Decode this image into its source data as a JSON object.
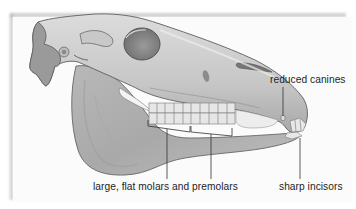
{
  "figure": {
    "style": "grayscale pencil illustration"
  },
  "labels": {
    "canines": "reduced canines",
    "molars": "large, flat molars and premolars",
    "incisors": "sharp incisors"
  },
  "colors": {
    "background": "#ffffff",
    "card": "#fbfbfb",
    "bone_light": "#d4d4d4",
    "bone_mid": "#b0b0b0",
    "bone_dark": "#7a7a7a",
    "outline": "#555555",
    "teeth": "#e8e8e8",
    "text": "#1e1e1e"
  }
}
